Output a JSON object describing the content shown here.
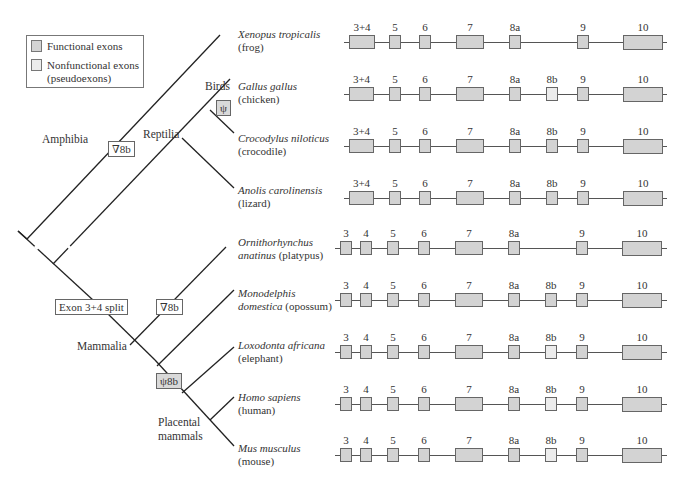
{
  "colors": {
    "functional_exon": "#d3d3d3",
    "nonfunctional_exon": "#ececec",
    "line": "#333333",
    "marker_filled": "#d9d9d9"
  },
  "legend": {
    "functional_label": "Functional exons",
    "nonfunctional_label": "Nonfunctional exons",
    "nonfunctional_sublabel": "(pseudoexons)"
  },
  "clades": {
    "amphibia": "Amphibia",
    "reptilia": "Reptilia",
    "birds": "Birds",
    "mammalia": "Mammalia",
    "placental_line1": "Placental",
    "placental_line2": "mammals"
  },
  "markers": {
    "amphibia_loss": "∇8b",
    "birds_pseudo": "ψ",
    "exon_split": "Exon 3+4 split",
    "monotreme_loss": "∇8b",
    "placental_pseudo": "ψ8b"
  },
  "species": [
    {
      "latin": "Xenopus tropicalis",
      "common": "(frog)",
      "exons": [
        {
          "label": "3+4",
          "x": 349,
          "w": 26,
          "type": "functional"
        },
        {
          "label": "5",
          "x": 389,
          "w": 12,
          "type": "functional"
        },
        {
          "label": "6",
          "x": 419,
          "w": 12,
          "type": "functional"
        },
        {
          "label": "7",
          "x": 456,
          "w": 28,
          "type": "functional"
        },
        {
          "label": "8a",
          "x": 509,
          "w": 12,
          "type": "functional"
        },
        {
          "label": "9",
          "x": 577,
          "w": 12,
          "type": "functional"
        },
        {
          "label": "10",
          "x": 623,
          "w": 40,
          "type": "functional"
        }
      ]
    },
    {
      "latin": "Gallus gallus",
      "common": "(chicken)",
      "exons": [
        {
          "label": "3+4",
          "x": 349,
          "w": 25,
          "type": "functional"
        },
        {
          "label": "5",
          "x": 389,
          "w": 12,
          "type": "functional"
        },
        {
          "label": "6",
          "x": 419,
          "w": 12,
          "type": "functional"
        },
        {
          "label": "7",
          "x": 456,
          "w": 28,
          "type": "functional"
        },
        {
          "label": "8a",
          "x": 509,
          "w": 12,
          "type": "functional"
        },
        {
          "label": "8b",
          "x": 546,
          "w": 12,
          "type": "pseudo"
        },
        {
          "label": "9",
          "x": 577,
          "w": 12,
          "type": "functional"
        },
        {
          "label": "10",
          "x": 623,
          "w": 40,
          "type": "functional"
        }
      ]
    },
    {
      "latin": "Crocodylus niloticus",
      "common": "(crocodile)",
      "exons": [
        {
          "label": "3+4",
          "x": 349,
          "w": 25,
          "type": "functional"
        },
        {
          "label": "5",
          "x": 389,
          "w": 12,
          "type": "functional"
        },
        {
          "label": "6",
          "x": 419,
          "w": 12,
          "type": "functional"
        },
        {
          "label": "7",
          "x": 456,
          "w": 28,
          "type": "functional"
        },
        {
          "label": "8a",
          "x": 509,
          "w": 12,
          "type": "functional"
        },
        {
          "label": "8b",
          "x": 546,
          "w": 12,
          "type": "functional"
        },
        {
          "label": "9",
          "x": 577,
          "w": 12,
          "type": "functional"
        },
        {
          "label": "10",
          "x": 623,
          "w": 40,
          "type": "functional"
        }
      ]
    },
    {
      "latin": "Anolis carolinensis",
      "common": "(lizard)",
      "exons": [
        {
          "label": "3+4",
          "x": 349,
          "w": 25,
          "type": "functional"
        },
        {
          "label": "5",
          "x": 389,
          "w": 12,
          "type": "functional"
        },
        {
          "label": "6",
          "x": 419,
          "w": 12,
          "type": "functional"
        },
        {
          "label": "7",
          "x": 456,
          "w": 28,
          "type": "functional"
        },
        {
          "label": "8a",
          "x": 509,
          "w": 12,
          "type": "functional"
        },
        {
          "label": "8b",
          "x": 546,
          "w": 12,
          "type": "functional"
        },
        {
          "label": "9",
          "x": 577,
          "w": 12,
          "type": "functional"
        },
        {
          "label": "10",
          "x": 623,
          "w": 40,
          "type": "functional"
        }
      ]
    },
    {
      "latin": "Ornithorhynchus",
      "latin2": "anatinus",
      "common": "(platypus)",
      "exons": [
        {
          "label": "3",
          "x": 340,
          "w": 12,
          "type": "functional"
        },
        {
          "label": "4",
          "x": 360,
          "w": 12,
          "type": "functional"
        },
        {
          "label": "5",
          "x": 387,
          "w": 12,
          "type": "functional"
        },
        {
          "label": "6",
          "x": 418,
          "w": 12,
          "type": "functional"
        },
        {
          "label": "7",
          "x": 455,
          "w": 28,
          "type": "functional"
        },
        {
          "label": "8a",
          "x": 508,
          "w": 12,
          "type": "functional"
        },
        {
          "label": "9",
          "x": 576,
          "w": 12,
          "type": "functional"
        },
        {
          "label": "10",
          "x": 622,
          "w": 40,
          "type": "functional"
        }
      ]
    },
    {
      "latin": "Monodelphis",
      "latin2": "domestica",
      "common": "(opossum)",
      "exons": [
        {
          "label": "3",
          "x": 340,
          "w": 12,
          "type": "functional"
        },
        {
          "label": "4",
          "x": 360,
          "w": 12,
          "type": "functional"
        },
        {
          "label": "5",
          "x": 387,
          "w": 12,
          "type": "functional"
        },
        {
          "label": "6",
          "x": 418,
          "w": 12,
          "type": "functional"
        },
        {
          "label": "7",
          "x": 455,
          "w": 28,
          "type": "functional"
        },
        {
          "label": "8a",
          "x": 508,
          "w": 12,
          "type": "functional"
        },
        {
          "label": "8b",
          "x": 545,
          "w": 12,
          "type": "functional"
        },
        {
          "label": "9",
          "x": 576,
          "w": 12,
          "type": "functional"
        },
        {
          "label": "10",
          "x": 622,
          "w": 40,
          "type": "functional"
        }
      ]
    },
    {
      "latin": "Loxodonta africana",
      "common": "(elephant)",
      "exons": [
        {
          "label": "3",
          "x": 340,
          "w": 12,
          "type": "functional"
        },
        {
          "label": "4",
          "x": 360,
          "w": 12,
          "type": "functional"
        },
        {
          "label": "5",
          "x": 387,
          "w": 12,
          "type": "functional"
        },
        {
          "label": "6",
          "x": 418,
          "w": 12,
          "type": "functional"
        },
        {
          "label": "7",
          "x": 455,
          "w": 28,
          "type": "functional"
        },
        {
          "label": "8a",
          "x": 508,
          "w": 12,
          "type": "functional"
        },
        {
          "label": "8b",
          "x": 545,
          "w": 12,
          "type": "pseudo"
        },
        {
          "label": "9",
          "x": 576,
          "w": 12,
          "type": "functional"
        },
        {
          "label": "10",
          "x": 622,
          "w": 40,
          "type": "functional"
        }
      ]
    },
    {
      "latin": "Homo sapiens",
      "common": "(human)",
      "exons": [
        {
          "label": "3",
          "x": 340,
          "w": 12,
          "type": "functional"
        },
        {
          "label": "4",
          "x": 360,
          "w": 12,
          "type": "functional"
        },
        {
          "label": "5",
          "x": 387,
          "w": 12,
          "type": "functional"
        },
        {
          "label": "6",
          "x": 418,
          "w": 12,
          "type": "functional"
        },
        {
          "label": "7",
          "x": 455,
          "w": 28,
          "type": "functional"
        },
        {
          "label": "8a",
          "x": 508,
          "w": 12,
          "type": "functional"
        },
        {
          "label": "8b",
          "x": 545,
          "w": 12,
          "type": "pseudo"
        },
        {
          "label": "9",
          "x": 576,
          "w": 12,
          "type": "functional"
        },
        {
          "label": "10",
          "x": 622,
          "w": 40,
          "type": "functional"
        }
      ]
    },
    {
      "latin": "Mus musculus",
      "common": "(mouse)",
      "exons": [
        {
          "label": "3",
          "x": 340,
          "w": 12,
          "type": "functional"
        },
        {
          "label": "4",
          "x": 360,
          "w": 12,
          "type": "functional"
        },
        {
          "label": "5",
          "x": 387,
          "w": 12,
          "type": "functional"
        },
        {
          "label": "6",
          "x": 418,
          "w": 12,
          "type": "functional"
        },
        {
          "label": "7",
          "x": 455,
          "w": 28,
          "type": "functional"
        },
        {
          "label": "8a",
          "x": 508,
          "w": 12,
          "type": "functional"
        },
        {
          "label": "8b",
          "x": 545,
          "w": 12,
          "type": "pseudo"
        },
        {
          "label": "9",
          "x": 576,
          "w": 12,
          "type": "functional"
        },
        {
          "label": "10",
          "x": 622,
          "w": 40,
          "type": "functional"
        }
      ]
    }
  ]
}
